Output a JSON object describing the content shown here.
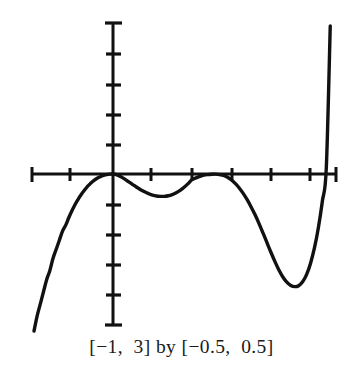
{
  "figure": {
    "caption": "[−1,  3] by [−0.5,  0.5]",
    "background_color": "#ffffff",
    "ink_color": "#111111"
  },
  "chart_data": {
    "type": "line",
    "title": "",
    "subtitle": "",
    "xlabel": "",
    "ylabel": "",
    "xlim": [
      -1,
      3
    ],
    "ylim": [
      -0.5,
      0.5
    ],
    "grid": false,
    "legend": null,
    "axes": {
      "x_axis_drawn": true,
      "y_axis_drawn": true,
      "x_tick_interval": 0.5,
      "y_tick_interval": 0.1,
      "x_ticks": [
        -1,
        -0.5,
        0,
        0.5,
        1,
        1.5,
        2,
        2.5,
        3
      ],
      "y_ticks": [
        -0.5,
        -0.4,
        -0.3,
        -0.2,
        -0.1,
        0,
        0.1,
        0.2,
        0.3,
        0.4,
        0.5
      ],
      "tick_labels_shown": false
    },
    "annotations": [],
    "series": [
      {
        "name": "curve",
        "line_color": "#111111",
        "line_width": 3.4,
        "x": [
          -1.0,
          -0.96,
          -0.92,
          -0.88,
          -0.84,
          -0.8,
          -0.76,
          -0.72,
          -0.68,
          -0.64,
          -0.6,
          -0.56,
          -0.52,
          -0.48,
          -0.44,
          -0.4,
          -0.36,
          -0.32,
          -0.28,
          -0.24,
          -0.2,
          -0.16,
          -0.12,
          -0.08,
          -0.04,
          0.0,
          0.05,
          0.1,
          0.15,
          0.2,
          0.25,
          0.3,
          0.35,
          0.4,
          0.45,
          0.5,
          0.55,
          0.6,
          0.65,
          0.7,
          0.75,
          0.8,
          0.85,
          0.9,
          0.95,
          1.0,
          1.05,
          1.1,
          1.15,
          1.2,
          1.25,
          1.3,
          1.35,
          1.4,
          1.45,
          1.5,
          1.55,
          1.6,
          1.65,
          1.7,
          1.75,
          1.8,
          1.85,
          1.9,
          1.95,
          2.0,
          2.05,
          2.1,
          2.15,
          2.2,
          2.25,
          2.3,
          2.35,
          2.4,
          2.45,
          2.5,
          2.55,
          2.6,
          2.65,
          2.7,
          2.75
        ],
        "y": [
          -0.52,
          -0.47,
          -0.43,
          -0.39,
          -0.35,
          -0.32,
          -0.28,
          -0.25,
          -0.22,
          -0.19,
          -0.17,
          -0.145,
          -0.122,
          -0.101,
          -0.083,
          -0.067,
          -0.053,
          -0.04,
          -0.03,
          -0.021,
          -0.014,
          -0.009,
          -0.005,
          -0.002,
          -0.0005,
          0.0,
          -0.003,
          -0.009,
          -0.017,
          -0.026,
          -0.035,
          -0.044,
          -0.052,
          -0.059,
          -0.065,
          -0.07,
          -0.073,
          -0.074,
          -0.074,
          -0.072,
          -0.068,
          -0.062,
          -0.054,
          -0.044,
          -0.032,
          -0.019,
          -0.013,
          -0.008,
          -0.004,
          -0.002,
          -0.0008,
          -0.0005,
          -0.002,
          -0.005,
          -0.011,
          -0.02,
          -0.032,
          -0.047,
          -0.065,
          -0.086,
          -0.11,
          -0.136,
          -0.165,
          -0.196,
          -0.228,
          -0.26,
          -0.29,
          -0.318,
          -0.341,
          -0.358,
          -0.369,
          -0.373,
          -0.37,
          -0.357,
          -0.333,
          -0.296,
          -0.245,
          -0.177,
          -0.09,
          0.02,
          0.49
        ],
        "features": {
          "left_branch": "falls steeply off bottom-left of window",
          "root_at_origin": "curve meets x-axis at x = 0",
          "local_min_1": {
            "x": 0.62,
            "y": -0.074
          },
          "local_max_tangent": {
            "x": 1.27,
            "y": -0.0005
          },
          "local_min_2": {
            "x": 2.31,
            "y": -0.373
          },
          "right_crossing": {
            "x": 2.63,
            "y": 0.0
          },
          "right_branch": "rises steeply off top of window"
        }
      }
    ]
  }
}
